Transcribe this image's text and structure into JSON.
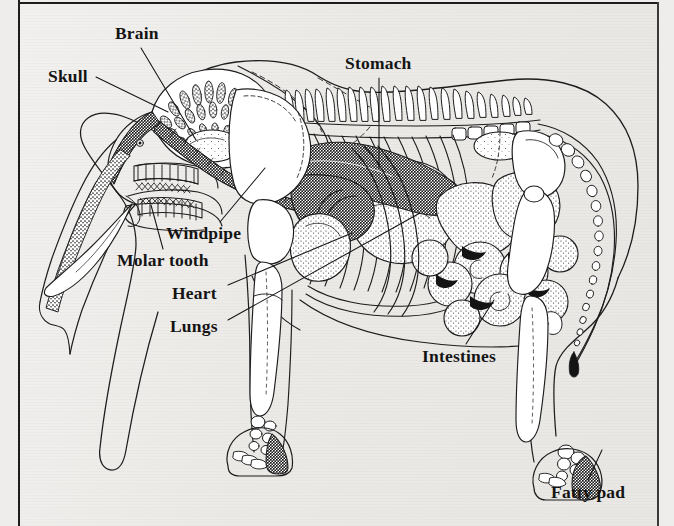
{
  "figure": {
    "style": "black-and-white-line-engraving",
    "page_background": "#eeedeb",
    "ink_color": "#1d1d1d",
    "border": {
      "left": true,
      "top": true,
      "right": true,
      "bottom": false
    }
  },
  "labels": [
    {
      "id": "brain",
      "text": "Brain",
      "x": 115,
      "y": 25,
      "anchor": "start"
    },
    {
      "id": "skull",
      "text": "Skull",
      "x": 48,
      "y": 68,
      "anchor": "start"
    },
    {
      "id": "stomach",
      "text": "Stomach",
      "x": 345,
      "y": 55,
      "anchor": "start"
    },
    {
      "id": "windpipe",
      "text": "Windpipe",
      "x": 166,
      "y": 225,
      "anchor": "start"
    },
    {
      "id": "molar-tooth",
      "text": "Molar tooth",
      "x": 117,
      "y": 252,
      "anchor": "start"
    },
    {
      "id": "heart",
      "text": "Heart",
      "x": 172,
      "y": 285,
      "anchor": "start"
    },
    {
      "id": "lungs",
      "text": "Lungs",
      "x": 170,
      "y": 318,
      "anchor": "start"
    },
    {
      "id": "intestines",
      "text": "Intestines",
      "x": 422,
      "y": 348,
      "anchor": "start"
    },
    {
      "id": "fatty-pad",
      "text": "Fatty pad",
      "x": 551,
      "y": 484,
      "anchor": "start"
    }
  ],
  "leader_lines": [
    {
      "id": "brain-leader",
      "from": [
        141,
        48
      ],
      "to": [
        196,
        140
      ]
    },
    {
      "id": "skull-leader",
      "from": [
        96,
        77
      ],
      "to": [
        168,
        112
      ]
    },
    {
      "id": "stomach-leader",
      "from": [
        379,
        78
      ],
      "to": [
        379,
        168
      ]
    },
    {
      "id": "windpipe-leader",
      "from": [
        220,
        222
      ],
      "to": [
        265,
        168
      ]
    },
    {
      "id": "molar-tooth-leader",
      "from": [
        163,
        249
      ],
      "to": [
        151,
        205
      ]
    },
    {
      "id": "heart-leader",
      "from": [
        228,
        285
      ],
      "to": [
        352,
        233
      ]
    },
    {
      "id": "lungs-leader",
      "from": [
        228,
        320
      ],
      "to": [
        420,
        213
      ]
    },
    {
      "id": "intestines-leader",
      "from": [
        466,
        344
      ],
      "to": [
        494,
        300
      ]
    },
    {
      "id": "fatty-pad-leader",
      "from": [
        588,
        480
      ],
      "to": [
        602,
        450
      ]
    }
  ],
  "anatomy_parts": [
    {
      "id": "skull-air-cells",
      "name": "skull air cell honeycomb"
    },
    {
      "id": "brain-organ",
      "name": "brain"
    },
    {
      "id": "trunk",
      "name": "trunk with nasal passage"
    },
    {
      "id": "tusk",
      "name": "tusk"
    },
    {
      "id": "molar-teeth",
      "name": "molar tooth rows"
    },
    {
      "id": "windpipe-tube",
      "name": "windpipe / trachea"
    },
    {
      "id": "spine",
      "name": "spine with dorsal processes"
    },
    {
      "id": "ribcage",
      "name": "ribcage"
    },
    {
      "id": "heart-organ",
      "name": "heart"
    },
    {
      "id": "lung-organ",
      "name": "lungs"
    },
    {
      "id": "stomach-organ",
      "name": "stomach"
    },
    {
      "id": "intestine-coils",
      "name": "intestines"
    },
    {
      "id": "scapula",
      "name": "shoulder blade"
    },
    {
      "id": "pelvis",
      "name": "pelvis"
    },
    {
      "id": "foreleg",
      "name": "foreleg bones"
    },
    {
      "id": "hindleg",
      "name": "hindleg bones"
    },
    {
      "id": "front-foot-pad",
      "name": "front foot fatty pad"
    },
    {
      "id": "rear-foot-pad",
      "name": "rear foot fatty pad"
    },
    {
      "id": "tail",
      "name": "tail vertebrae"
    },
    {
      "id": "body-outline",
      "name": "body silhouette outline"
    },
    {
      "id": "ear-outline",
      "name": "ear outline"
    }
  ]
}
